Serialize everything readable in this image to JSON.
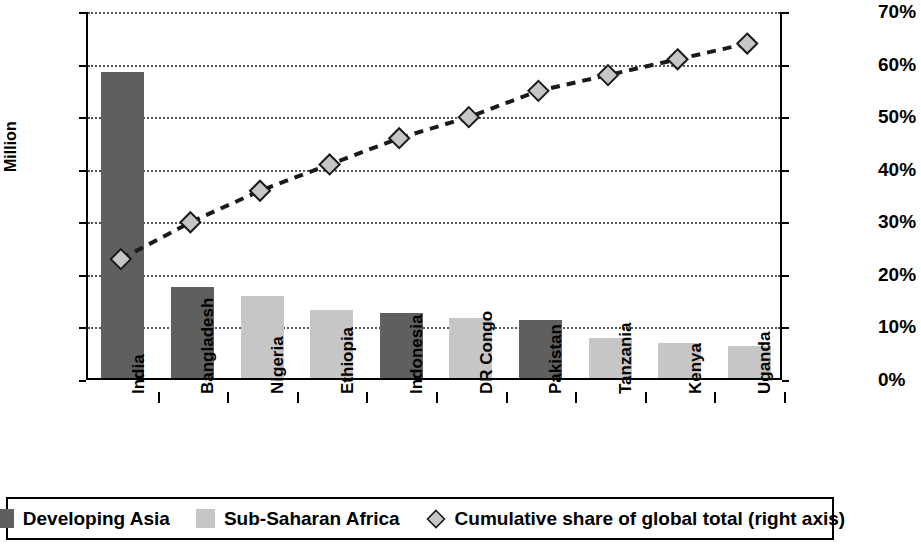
{
  "chart_data": {
    "type": "bar",
    "title": "",
    "subtitle": "",
    "categories": [
      "India",
      "Bangladesh",
      "Nigeria",
      "Ethiopia",
      "Indonesia",
      "DR Congo",
      "Pakistan",
      "Tanzania",
      "Kenya",
      "Uganda"
    ],
    "series": [
      {
        "name": "Developing Asia",
        "type": "bar",
        "axis": "left",
        "color": "#5f5f5f",
        "values": [
          291,
          87,
          null,
          null,
          62,
          null,
          55,
          null,
          null,
          null
        ]
      },
      {
        "name": "Sub-Saharan Africa",
        "type": "bar",
        "axis": "left",
        "color": "#c6c6c6",
        "values": [
          null,
          null,
          78,
          65,
          null,
          57,
          null,
          38,
          33,
          30
        ]
      },
      {
        "name": "Cumulative share of global total (right axis)",
        "type": "line",
        "axis": "right",
        "marker": "diamond",
        "linestyle": "dashed",
        "color": "#1a1a1a",
        "values": [
          23,
          30,
          36,
          41,
          46,
          50,
          55,
          58,
          61,
          64
        ]
      }
    ],
    "bar_values_combined": [
      291,
      87,
      78,
      65,
      62,
      57,
      55,
      38,
      33,
      30
    ],
    "bar_groups": [
      "Developing Asia",
      "Developing Asia",
      "Sub-Saharan Africa",
      "Sub-Saharan Africa",
      "Developing Asia",
      "Sub-Saharan Africa",
      "Developing Asia",
      "Sub-Saharan Africa",
      "Sub-Saharan Africa",
      "Sub-Saharan Africa"
    ],
    "xlabel": "",
    "ylabel": "Million",
    "ylabel_right": "",
    "ylim": [
      0,
      350
    ],
    "ylim_right": [
      0,
      70
    ],
    "yticks": [
      0,
      50,
      100,
      150,
      200,
      250,
      300,
      350
    ],
    "ytick_labels": [
      "0",
      "50",
      "100",
      "150",
      "200",
      "250",
      "300",
      "350"
    ],
    "yticks_right": [
      0,
      10,
      20,
      30,
      40,
      50,
      60,
      70
    ],
    "ytick_labels_right": [
      "0%",
      "10%",
      "20%",
      "30%",
      "40%",
      "50%",
      "60%",
      "70%"
    ],
    "grid": true,
    "grid_style": "dotted-horizontal",
    "legend_position": "bottom"
  },
  "axes": {
    "left_title": "Million",
    "left_ticks": [
      "350",
      "300",
      "250",
      "200",
      "150",
      "100",
      "50",
      "0"
    ],
    "right_ticks": [
      "70%",
      "60%",
      "50%",
      "40%",
      "30%",
      "20%",
      "10%",
      "0%"
    ]
  },
  "legend": {
    "items": [
      {
        "label": "Developing Asia",
        "marker": "square",
        "color": "#5f5f5f"
      },
      {
        "label": "Sub-Saharan Africa",
        "marker": "square",
        "color": "#c6c6c6"
      },
      {
        "label": "Cumulative share of global total (right axis)",
        "marker": "diamond",
        "color": "#c6c6c6"
      }
    ]
  },
  "colors": {
    "developing_asia": "#5f5f5f",
    "sub_saharan_africa": "#c6c6c6",
    "line": "#1a1a1a",
    "axis": "#000000",
    "grid": "#555555"
  }
}
